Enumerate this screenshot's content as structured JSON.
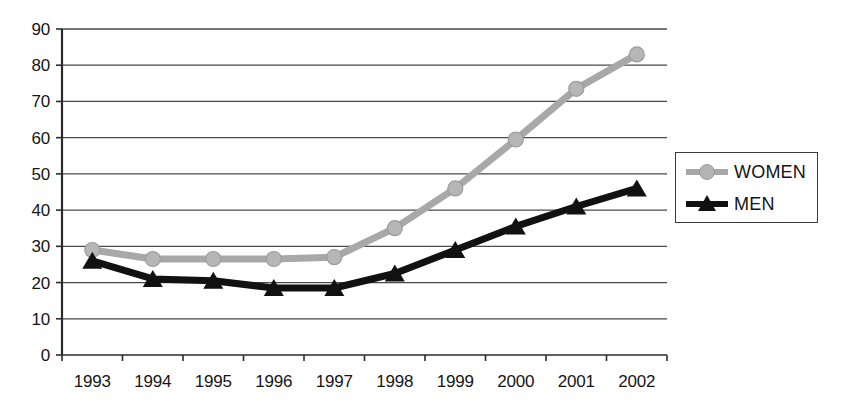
{
  "chart_data": {
    "type": "line",
    "title": "",
    "subtitle": "",
    "xlabel": "",
    "ylabel": "",
    "categories": [
      "1993",
      "1994",
      "1995",
      "1996",
      "1997",
      "1998",
      "1999",
      "2000",
      "2001",
      "2002"
    ],
    "series": [
      {
        "name": "WOMEN",
        "color": "#a8a8a8",
        "marker": "circle",
        "values": [
          29,
          26.5,
          26.5,
          26.5,
          27,
          35,
          46,
          59.5,
          73.5,
          83
        ]
      },
      {
        "name": "MEN",
        "color": "#111111",
        "marker": "triangle",
        "values": [
          26,
          21,
          20.5,
          18.5,
          18.5,
          22.5,
          29,
          35.5,
          41,
          46
        ]
      }
    ],
    "ylim": [
      0,
      90
    ],
    "ytick_step": 10,
    "yticks": [
      "90",
      "80",
      "70",
      "60",
      "50",
      "40",
      "30",
      "20",
      "10",
      "0"
    ],
    "grid": true,
    "grid_axis": "y",
    "legend": {
      "position": "right",
      "entries": [
        {
          "label": "WOMEN",
          "marker": "circle-marker",
          "color": "#a8a8a8"
        },
        {
          "label": "MEN",
          "marker": "triangle-marker",
          "color": "#111111"
        }
      ]
    },
    "axis_color": "#2b2b2b",
    "grid_color": "#4a4a4a",
    "background": "#ffffff"
  }
}
